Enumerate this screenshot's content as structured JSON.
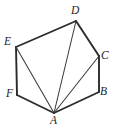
{
  "figure": {
    "kind": "geometry-diagram",
    "shape_name": "hexagon",
    "background_color": "#ffffff",
    "edge_color": "#2b2b2b",
    "diagonal_color": "#3a3a3a",
    "label_color": "#232323",
    "canvas": {
      "width": 116,
      "height": 130
    }
  },
  "vertices": [
    {
      "id": "A",
      "label": "A",
      "x": 54,
      "y": 113,
      "label_x": 50,
      "label_y": 115
    },
    {
      "id": "B",
      "label": "B",
      "x": 99,
      "y": 92,
      "label_x": 100,
      "label_y": 86
    },
    {
      "id": "C",
      "label": "C",
      "x": 99,
      "y": 56,
      "label_x": 101,
      "label_y": 50
    },
    {
      "id": "D",
      "label": "D",
      "x": 76,
      "y": 21,
      "label_x": 71,
      "label_y": 5
    },
    {
      "id": "E",
      "label": "E",
      "x": 16,
      "y": 47,
      "label_x": 4,
      "label_y": 36
    },
    {
      "id": "F",
      "label": "F",
      "x": 17,
      "y": 95,
      "label_x": 6,
      "label_y": 88
    }
  ],
  "edges": [
    {
      "from": "A",
      "to": "B",
      "kind": "boundary"
    },
    {
      "from": "B",
      "to": "C",
      "kind": "boundary"
    },
    {
      "from": "C",
      "to": "D",
      "kind": "boundary"
    },
    {
      "from": "D",
      "to": "E",
      "kind": "boundary"
    },
    {
      "from": "E",
      "to": "F",
      "kind": "boundary"
    },
    {
      "from": "F",
      "to": "A",
      "kind": "boundary"
    }
  ],
  "diagonals": [
    {
      "from": "A",
      "to": "C",
      "kind": "diagonal"
    },
    {
      "from": "A",
      "to": "D",
      "kind": "diagonal"
    },
    {
      "from": "A",
      "to": "E",
      "kind": "diagonal"
    }
  ]
}
